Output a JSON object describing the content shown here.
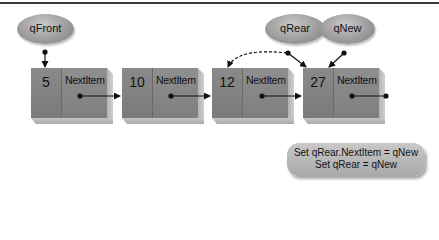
{
  "diagram": {
    "title_rule": true,
    "pointers": [
      {
        "id": "qFront",
        "label": "qFront",
        "targets_node": 0
      },
      {
        "id": "qRear",
        "label": "qRear",
        "targets_node": 3,
        "previous_target_node": 2,
        "previous_link_style": "dashed"
      },
      {
        "id": "qNew",
        "label": "qNew",
        "targets_node": 3
      }
    ],
    "nodes": [
      {
        "value": "5",
        "next_label": "NextItem"
      },
      {
        "value": "10",
        "next_label": "NextItem"
      },
      {
        "value": "12",
        "next_label": "NextItem"
      },
      {
        "value": "27",
        "next_label": "NextItem"
      }
    ],
    "code": {
      "line1": "Set qRear.NextItem = qNew",
      "line2": "Set qRear = qNew"
    },
    "colors": {
      "node_fill": "#858585",
      "bubble_fill": "#a8a8a8",
      "arrow": "#111111",
      "background": "#ffffff"
    }
  }
}
